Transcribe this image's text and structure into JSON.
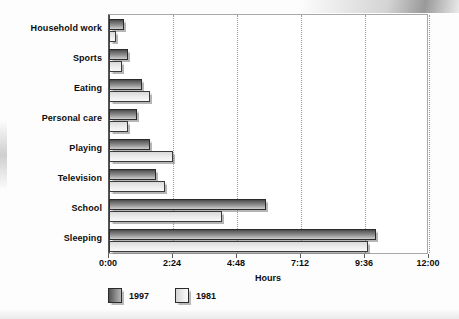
{
  "chart_data": {
    "type": "bar",
    "orientation": "horizontal",
    "title": "",
    "xlabel": "Hours",
    "ylabel": "",
    "categories": [
      "Household work",
      "Sports",
      "Eating",
      "Personal care",
      "Playing",
      "Television",
      "School",
      "Sleeping"
    ],
    "series": [
      {
        "name": "1997",
        "color": "#6b6b6b",
        "values": [
          0.55,
          0.7,
          1.25,
          1.05,
          1.55,
          1.75,
          5.9,
          10.0
        ]
      },
      {
        "name": "1981",
        "color": "#e8e8e8",
        "values": [
          0.25,
          0.5,
          1.55,
          0.7,
          2.4,
          2.1,
          4.25,
          9.7
        ]
      }
    ],
    "xlim": [
      0,
      12
    ],
    "xtick_values": [
      0,
      2.4,
      4.8,
      7.2,
      9.6,
      12
    ],
    "xtick_labels": [
      "0:00",
      "2:24",
      "4:48",
      "7:12",
      "9:36",
      "12:00"
    ],
    "grid": "vertical-dotted",
    "legend_position": "bottom-left",
    "value_format": "hours"
  },
  "legend": {
    "items": [
      {
        "label": "1997",
        "swatch": "dark-gradient-swatch"
      },
      {
        "label": "1981",
        "swatch": "light-gradient-swatch"
      }
    ]
  }
}
